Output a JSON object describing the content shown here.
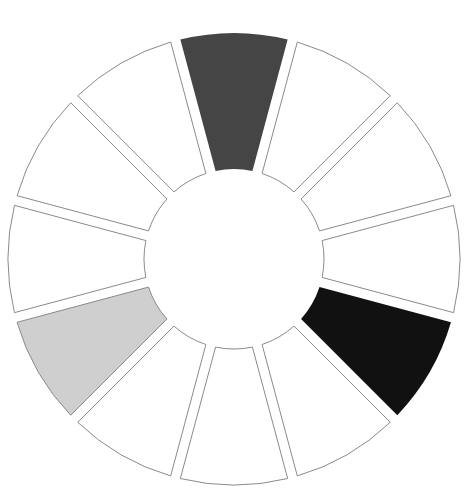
{
  "diagram": {
    "type": "segmented-wheel",
    "center": [
      234,
      259
    ],
    "inner_radius": 90,
    "outer_radius": 226,
    "gap": 10,
    "segment_count": 12,
    "segments": [
      {
        "index": 0,
        "angle_deg": -90,
        "fill": "#454545",
        "filled": true
      },
      {
        "index": 1,
        "angle_deg": -60,
        "fill": "#ffffff",
        "filled": false
      },
      {
        "index": 2,
        "angle_deg": -30,
        "fill": "#ffffff",
        "filled": false
      },
      {
        "index": 3,
        "angle_deg": 0,
        "fill": "#ffffff",
        "filled": false
      },
      {
        "index": 4,
        "angle_deg": 30,
        "fill": "#111111",
        "filled": true
      },
      {
        "index": 5,
        "angle_deg": 60,
        "fill": "#ffffff",
        "filled": false
      },
      {
        "index": 6,
        "angle_deg": 90,
        "fill": "#ffffff",
        "filled": false
      },
      {
        "index": 7,
        "angle_deg": 120,
        "fill": "#ffffff",
        "filled": false
      },
      {
        "index": 8,
        "angle_deg": 150,
        "fill": "#cfcfcf",
        "filled": true
      },
      {
        "index": 9,
        "angle_deg": 180,
        "fill": "#ffffff",
        "filled": false
      },
      {
        "index": 10,
        "angle_deg": 210,
        "fill": "#ffffff",
        "filled": false
      },
      {
        "index": 11,
        "angle_deg": 240,
        "fill": "#ffffff",
        "filled": false
      }
    ],
    "outline_color": "#8a8a8a",
    "background": "#ffffff"
  }
}
